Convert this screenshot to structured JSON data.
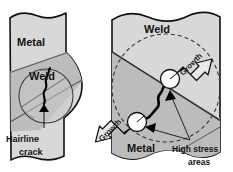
{
  "figure": {
    "title_present": false,
    "panels": [
      {
        "id": "left-panel",
        "name": "hairline-crack-stage",
        "labels": {
          "metal": "Metal",
          "weld": "Weld",
          "callout": "Hairline\ncrack",
          "callout_line1": "Hairline",
          "callout_line2": "crack"
        }
      },
      {
        "id": "right-panel",
        "name": "crack-growth-stage",
        "labels": {
          "weld": "Weld",
          "metal": "Metal",
          "growth_upper": "Growth",
          "growth_lower": "Growth",
          "stress_line1": "High stress",
          "stress_line2": "areas"
        }
      }
    ]
  },
  "colors": {
    "metal_fill": "#d8d8d8",
    "weld_fill": "#bcbcbc",
    "outline": "#111111",
    "crack": "#000000",
    "circle_fill": "#ffffff",
    "arrow_fill": "#e8e8e8",
    "background": "#ffffff",
    "text": "#141414"
  }
}
